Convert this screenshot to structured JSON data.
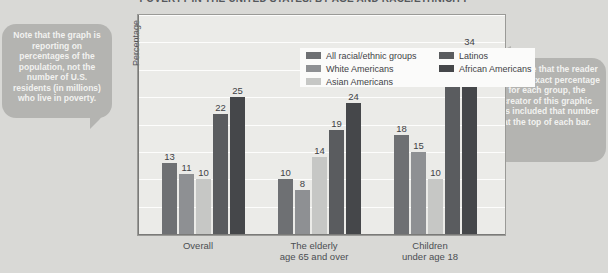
{
  "chart_data": {
    "type": "bar",
    "title": "POVERTY IN THE UNITED STATES, BY AGE AND RACE/ETHNICITY",
    "xlabel": "",
    "ylabel": "Percentage",
    "ylim": [
      0,
      40
    ],
    "ytick_labels": [
      "0%",
      "5%",
      "10%",
      "15%",
      "20%",
      "25%",
      "30%",
      "35%",
      "40%"
    ],
    "ytick_values": [
      0,
      5,
      10,
      15,
      20,
      25,
      30,
      35,
      40
    ],
    "grid": true,
    "legend_position": "upper-left-inside",
    "categories": [
      "Overall",
      "The elderly\nage 65 and over",
      "Children\nunder age 18"
    ],
    "category_lines": [
      [
        "Overall"
      ],
      [
        "The elderly",
        "age 65 and over"
      ],
      [
        "Children",
        "under age 18"
      ]
    ],
    "series": [
      {
        "name": "All racial/ethnic groups",
        "color": "#6e7073",
        "values": [
          13,
          10,
          18
        ]
      },
      {
        "name": "White Americans",
        "color": "#8e9093",
        "values": [
          11,
          8,
          15
        ]
      },
      {
        "name": "Asian Americans",
        "color": "#c6c7c5",
        "values": [
          10,
          14,
          10
        ]
      },
      {
        "name": "Latinos",
        "color": "#5a5c5f",
        "values": [
          22,
          19,
          29
        ]
      },
      {
        "name": "African Americans",
        "color": "#45474a",
        "values": [
          25,
          24,
          34
        ]
      }
    ]
  },
  "callouts": {
    "left": "Note that the graph is reporting on percentages of the population, not the number of U.S. residents (in millions) who live in poverty.",
    "right": "To ensure that the reader sees the exact percentage for each group, the creator of this graphic has included that number at the top of each bar."
  },
  "colors": {
    "page_background": "#d9d9d6",
    "plot_background": "#ebebe8",
    "legend_background": "#fbfbfa",
    "callout_background": "#b4b4b1",
    "axis": "#7a7a78",
    "text": "#4b4e52"
  }
}
